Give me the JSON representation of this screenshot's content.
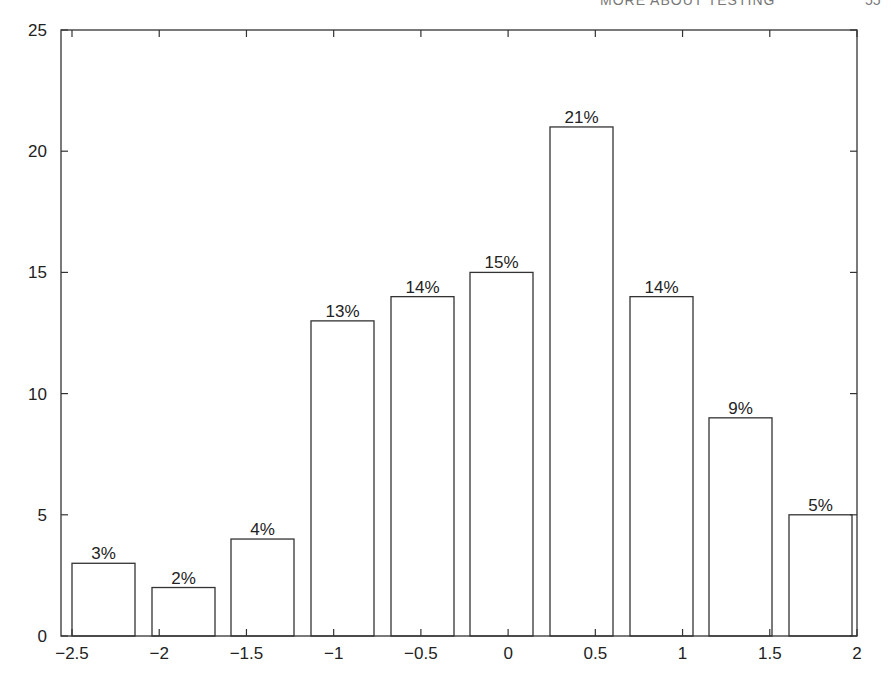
{
  "header": {
    "running_title": "MORE ABOUT TESTING",
    "page_number": "55"
  },
  "chart_data": {
    "type": "bar",
    "title": "",
    "xlabel": "",
    "ylabel": "",
    "xlim": [
      -2.5,
      2
    ],
    "ylim": [
      0,
      25
    ],
    "grid": false,
    "x_ticks": [
      -2.5,
      -2,
      -1.5,
      -1,
      -0.5,
      0,
      0.5,
      1,
      1.5,
      2
    ],
    "x_tick_labels": [
      "−2.5",
      "−2",
      "−1.5",
      "−1",
      "−0.5",
      "0",
      "0.5",
      "1",
      "1.5",
      "2"
    ],
    "y_ticks": [
      0,
      5,
      10,
      15,
      20,
      25
    ],
    "y_tick_labels": [
      "0",
      "5",
      "10",
      "15",
      "20",
      "25"
    ],
    "bars": [
      {
        "x0": 72,
        "x1": 135,
        "value": 3,
        "label": "3%"
      },
      {
        "x0": 152,
        "x1": 215,
        "value": 2,
        "label": "2%"
      },
      {
        "x0": 231,
        "x1": 294,
        "value": 4,
        "label": "4%"
      },
      {
        "x0": 311,
        "x1": 374,
        "value": 13,
        "label": "13%"
      },
      {
        "x0": 391,
        "x1": 454,
        "value": 14,
        "label": "14%"
      },
      {
        "x0": 470,
        "x1": 533,
        "value": 15,
        "label": "15%"
      },
      {
        "x0": 550,
        "x1": 613,
        "value": 21,
        "label": "21%"
      },
      {
        "x0": 630,
        "x1": 693,
        "value": 14,
        "label": "14%"
      },
      {
        "x0": 709,
        "x1": 772,
        "value": 9,
        "label": "9%"
      },
      {
        "x0": 789,
        "x1": 852,
        "value": 5,
        "label": "5%"
      }
    ],
    "bin_centers": [
      -2.32,
      -1.87,
      -1.41,
      -0.96,
      -0.5,
      -0.05,
      0.41,
      0.86,
      1.32,
      1.77
    ],
    "values": [
      3,
      2,
      4,
      13,
      14,
      15,
      21,
      14,
      9,
      5
    ],
    "labels": [
      "3%",
      "2%",
      "4%",
      "13%",
      "14%",
      "15%",
      "21%",
      "14%",
      "9%",
      "5%"
    ]
  }
}
